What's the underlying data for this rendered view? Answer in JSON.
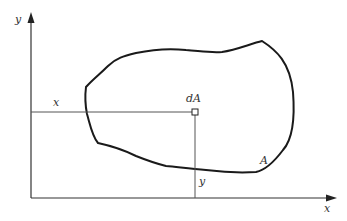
{
  "figure": {
    "axes": {
      "x_label": "x",
      "y_label": "y"
    },
    "element": {
      "label": "dA",
      "x_distance_label": "x",
      "y_distance_label": "y"
    },
    "region": {
      "label": "A"
    },
    "colors": {
      "stroke": "#1a1a1a",
      "axis": "#333333",
      "guide": "#555555",
      "text": "#333333",
      "background": "#ffffff"
    }
  }
}
